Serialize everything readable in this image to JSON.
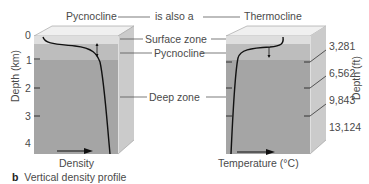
{
  "header": {
    "left_label": "Pycnocline",
    "connector": "is also a",
    "right_label": "Thermocline"
  },
  "zones": {
    "surface": "Surface zone",
    "pycnocline": "Pycnocline",
    "deep": "Deep zone"
  },
  "left_axis": {
    "label": "Depth (km)",
    "ticks": [
      "0",
      "1",
      "2",
      "3",
      "4"
    ]
  },
  "right_axis": {
    "label": "Depth (ft)",
    "ticks": [
      "3,281",
      "6,562",
      "9,843",
      "13,124"
    ]
  },
  "left_panel": {
    "x_label": "Density"
  },
  "right_panel": {
    "x_label": "Temperature (°C)"
  },
  "caption": {
    "letter": "b",
    "text": "Vertical density profile"
  },
  "colors": {
    "surface": "#dcdcdc",
    "pycnocline": "#b9b9b9",
    "deep": "#a4a4a4",
    "top_face": "#eeeeee",
    "side_face": "#c8c8c8",
    "curve": "#111111"
  }
}
